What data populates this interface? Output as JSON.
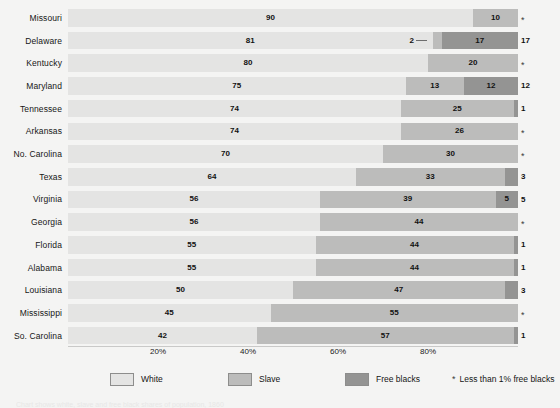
{
  "chart_data": {
    "type": "bar",
    "subtype": "horizontal-stacked-percent",
    "title": "",
    "xlabel": "",
    "ylabel": "",
    "xlim": [
      0,
      100
    ],
    "grid": false,
    "legend_position": "bottom",
    "categories": [
      "Missouri",
      "Delaware",
      "Kentucky",
      "Maryland",
      "Tennessee",
      "Arkansas",
      "No. Carolina",
      "Texas",
      "Virginia",
      "Georgia",
      "Florida",
      "Alabama",
      "Louisiana",
      "Mississippi",
      "So. Carolina"
    ],
    "series": [
      {
        "name": "White",
        "values": [
          90,
          81,
          80,
          75,
          74,
          74,
          70,
          64,
          56,
          56,
          55,
          55,
          50,
          45,
          42
        ]
      },
      {
        "name": "Slave",
        "values": [
          10,
          2,
          20,
          13,
          25,
          26,
          30,
          33,
          39,
          44,
          44,
          44,
          47,
          55,
          57
        ]
      },
      {
        "name": "Free blacks",
        "values": [
          0,
          17,
          0,
          12,
          1,
          0,
          0,
          3,
          5,
          0,
          1,
          1,
          3,
          0,
          1
        ]
      }
    ],
    "tick_labels": [
      "20%",
      "40%",
      "60%",
      "80%"
    ],
    "tick_values": [
      20,
      40,
      60,
      80
    ],
    "free_black_markers": [
      "*",
      "17",
      "*",
      "12",
      "1",
      "*",
      "*",
      "3",
      "5",
      "*",
      "1",
      "1",
      "3",
      "*",
      "1"
    ],
    "annotations": [
      {
        "row": "Delaware",
        "label": "2",
        "series": "Slave",
        "style": "leader-line"
      }
    ],
    "colors": {
      "white": "#e4e4e3",
      "slave": "#bcbcbb",
      "free_blacks": "#949493",
      "background": "#f4f4f3",
      "text": "#1a1a1a"
    }
  },
  "rows": [
    {
      "label": "Missouri",
      "white": 90,
      "slave": 10,
      "free": 0,
      "marker": "*",
      "marker_is_star": true
    },
    {
      "label": "Delaware",
      "white": 81,
      "slave": 2,
      "free": 17,
      "marker": "17",
      "marker_is_star": false
    },
    {
      "label": "Kentucky",
      "white": 80,
      "slave": 20,
      "free": 0,
      "marker": "*",
      "marker_is_star": true
    },
    {
      "label": "Maryland",
      "white": 75,
      "slave": 13,
      "free": 12,
      "marker": "12",
      "marker_is_star": false
    },
    {
      "label": "Tennessee",
      "white": 74,
      "slave": 25,
      "free": 1,
      "marker": "1",
      "marker_is_star": false
    },
    {
      "label": "Arkansas",
      "white": 74,
      "slave": 26,
      "free": 0,
      "marker": "*",
      "marker_is_star": true
    },
    {
      "label": "No. Carolina",
      "white": 70,
      "slave": 30,
      "free": 0,
      "marker": "*",
      "marker_is_star": true
    },
    {
      "label": "Texas",
      "white": 64,
      "slave": 33,
      "free": 3,
      "marker": "3",
      "marker_is_star": false
    },
    {
      "label": "Virginia",
      "white": 56,
      "slave": 39,
      "free": 5,
      "marker": "5",
      "marker_is_star": false
    },
    {
      "label": "Georgia",
      "white": 56,
      "slave": 44,
      "free": 0,
      "marker": "*",
      "marker_is_star": true
    },
    {
      "label": "Florida",
      "white": 55,
      "slave": 44,
      "free": 1,
      "marker": "1",
      "marker_is_star": false
    },
    {
      "label": "Alabama",
      "white": 55,
      "slave": 44,
      "free": 1,
      "marker": "1",
      "marker_is_star": false
    },
    {
      "label": "Louisiana",
      "white": 50,
      "slave": 47,
      "free": 3,
      "marker": "3",
      "marker_is_star": false
    },
    {
      "label": "Mississippi",
      "white": 45,
      "slave": 55,
      "free": 0,
      "marker": "*",
      "marker_is_star": true
    },
    {
      "label": "So. Carolina",
      "white": 42,
      "slave": 57,
      "free": 1,
      "marker": "1",
      "marker_is_star": false
    }
  ],
  "delaware_callout": {
    "value": "2"
  },
  "axis": {
    "ticks": [
      "20%",
      "40%",
      "60%",
      "80%"
    ]
  },
  "legend": {
    "items": [
      {
        "key": "white",
        "label": "White"
      },
      {
        "key": "slave",
        "label": "Slave"
      },
      {
        "key": "free",
        "label": "Free blacks"
      }
    ],
    "footnote_symbol": "*",
    "footnote_text": "Less than 1% free blacks"
  },
  "caption_cut": "Chart shows white, slave and free black shares of population, 1860"
}
